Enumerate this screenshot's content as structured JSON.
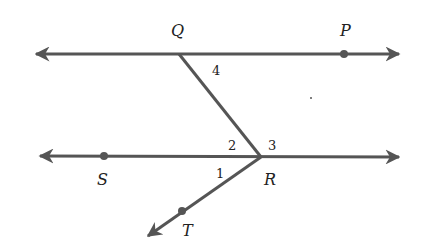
{
  "diagram": {
    "type": "geometry",
    "points": [
      {
        "name": "Q",
        "label": "Q"
      },
      {
        "name": "P",
        "label": "P"
      },
      {
        "name": "S",
        "label": "S"
      },
      {
        "name": "R",
        "label": "R"
      },
      {
        "name": "T",
        "label": "T"
      }
    ],
    "angles": [
      {
        "label": "1"
      },
      {
        "label": "2"
      },
      {
        "label": "3"
      },
      {
        "label": "4"
      }
    ],
    "colors": {
      "line": "#555555",
      "text": "#222222"
    }
  }
}
